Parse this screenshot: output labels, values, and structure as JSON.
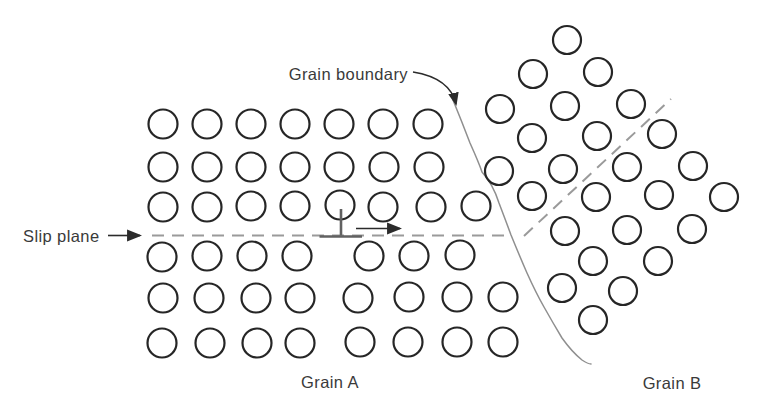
{
  "figure": {
    "labels": {
      "grain_boundary": "Grain boundary",
      "slip_plane": "Slip plane",
      "grain_a": "Grain A",
      "grain_b": "Grain B"
    },
    "colors": {
      "background": "#ffffff",
      "atom_stroke": "#262626",
      "text": "#3a3a3a",
      "dashed_line": "#9a9a9a",
      "grain_boundary_line": "#8f8f8f",
      "dislocation_symbol": "#616161",
      "arrow": "#2b2b2b"
    },
    "atom_radius": {
      "grain_a": 14.5,
      "grain_b": 14
    },
    "grain_a_atoms": [
      [
        163,
        124
      ],
      [
        207,
        124
      ],
      [
        251,
        124
      ],
      [
        295,
        124
      ],
      [
        339,
        124
      ],
      [
        383,
        124
      ],
      [
        428,
        124
      ],
      [
        163,
        167
      ],
      [
        207,
        167
      ],
      [
        251,
        167
      ],
      [
        295,
        167
      ],
      [
        339,
        167
      ],
      [
        384,
        167
      ],
      [
        429,
        167
      ],
      [
        163,
        207
      ],
      [
        207,
        207
      ],
      [
        251,
        206
      ],
      [
        295,
        206
      ],
      [
        340,
        205
      ],
      [
        383,
        207
      ],
      [
        431,
        207
      ],
      [
        476,
        206
      ],
      [
        162,
        257
      ],
      [
        207,
        256
      ],
      [
        252,
        256
      ],
      [
        297,
        256
      ],
      [
        369,
        256
      ],
      [
        414,
        256
      ],
      [
        460,
        255
      ],
      [
        163,
        298
      ],
      [
        209,
        298
      ],
      [
        256,
        298
      ],
      [
        300,
        298
      ],
      [
        358,
        298
      ],
      [
        409,
        297
      ],
      [
        457,
        297
      ],
      [
        503,
        297
      ],
      [
        162,
        343
      ],
      [
        210,
        343
      ],
      [
        257,
        343
      ],
      [
        300,
        343
      ],
      [
        360,
        342
      ],
      [
        408,
        342
      ],
      [
        457,
        342
      ],
      [
        503,
        342
      ]
    ],
    "grain_b_atoms": [
      [
        567,
        40
      ],
      [
        533,
        74
      ],
      [
        598,
        72
      ],
      [
        500,
        109
      ],
      [
        565,
        106
      ],
      [
        631,
        104
      ],
      [
        532,
        138
      ],
      [
        597,
        136
      ],
      [
        662,
        134
      ],
      [
        499,
        171
      ],
      [
        563,
        169
      ],
      [
        627,
        167
      ],
      [
        693,
        166
      ],
      [
        532,
        196
      ],
      [
        596,
        197
      ],
      [
        659,
        195
      ],
      [
        724,
        197
      ],
      [
        565,
        231
      ],
      [
        627,
        230
      ],
      [
        692,
        229
      ],
      [
        593,
        261
      ],
      [
        658,
        261
      ],
      [
        562,
        288
      ],
      [
        623,
        291
      ],
      [
        593,
        320
      ]
    ],
    "geometry": {
      "slip_dashed_line": {
        "x1": 152,
        "y1": 235.5,
        "x2": 506,
        "y2": 235.5
      },
      "grain_b_dashed_line": {
        "x1": 524,
        "y1": 236,
        "x2": 671,
        "y2": 99
      },
      "slip_label_arrow": {
        "x1": 108,
        "y1": 235.5,
        "x2": 140,
        "y2": 235.5
      },
      "motion_arrow": {
        "x1": 356,
        "y1": 228.5,
        "x2": 400,
        "y2": 228.5
      },
      "dislocation_stem": {
        "x1": 341,
        "y1": 209,
        "x2": 341,
        "y2": 235.5
      },
      "dislocation_bar": {
        "x1": 319.5,
        "y1": 236.5,
        "x2": 362,
        "y2": 236.5
      },
      "grain_boundary_path": {
        "d": "M 453 100 Q 462 122 470 143 Q 479 163 482 172 Q 493 184 499 203 Q 507 224 511 235 Q 520 257 527 273 Q 536 293 544 307 Q 553 323 562 338 Q 572 352 582 360 Q 588 364 591 364"
      },
      "leader_path": {
        "d": "M 413 72 Q 450 78 456 104"
      },
      "label_positions": {
        "grain_boundary": {
          "x": 408,
          "y": 80,
          "text-anchor": "end"
        },
        "slip_plane": {
          "x": 23,
          "y": 242,
          "text-anchor": "start"
        },
        "grain_a": {
          "x": 330,
          "y": 388,
          "text-anchor": "middle"
        },
        "grain_b": {
          "x": 672,
          "y": 389,
          "text-anchor": "middle"
        }
      }
    }
  }
}
